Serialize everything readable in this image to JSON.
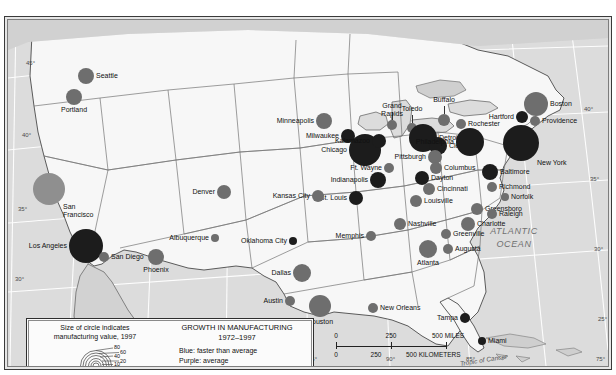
{
  "map": {
    "ocean_label": "ATLANTIC\nOCEAN",
    "ocean_line1": "ATLANTIC",
    "ocean_line2": "OCEAN",
    "tropic_label": "Tropic of Cancer",
    "lat_left": [
      "45°",
      "40°",
      "35°",
      "30°"
    ],
    "lat_right": [
      "40°",
      "35°",
      "30°",
      "25°"
    ],
    "lon_bottom": [
      "95°",
      "90°",
      "85°",
      "75°"
    ],
    "colors": {
      "land": "#f7f7f7",
      "ocean": "#dcdcdc",
      "border": "#2e2e2e",
      "red_slower": "#1c1c1c",
      "purple_average": "#6e6e6e",
      "blue_faster": "#8f8f8f"
    }
  },
  "legend": {
    "size_caption_line1": "Size of circle indicates",
    "size_caption_line2": "manufacturing value, 1997",
    "scale_values": [
      "80",
      "60",
      "40",
      "20",
      "10",
      "5"
    ],
    "title_line1": "GROWTH IN MANUFACTURING",
    "title_line2": "1972–1997",
    "keys": [
      "Blue:  faster than average",
      "Purple:  average",
      "Red:  slower than average"
    ]
  },
  "scalebar": {
    "miles": [
      "0",
      "250",
      "500 MILES"
    ],
    "kilometers": [
      "0",
      "250",
      "500 KILOMETERS"
    ],
    "miles_numbers": [
      "0",
      "250"
    ],
    "miles_unit": "500 MILES",
    "km_numbers": [
      "0",
      "250"
    ],
    "km_unit": "500 KILOMETERS"
  },
  "chart_data": {
    "type": "scatter",
    "title": "GROWTH IN MANUFACTURING 1972–1997",
    "xlabel": "Longitude",
    "ylabel": "Latitude",
    "size_encoding": "manufacturing value, 1997 (billions of dollars)",
    "size_legend_values": [
      80,
      60,
      40,
      20,
      10,
      5
    ],
    "color_encoding": {
      "blue": "faster than average",
      "purple": "average",
      "red": "slower than average"
    },
    "cities": [
      {
        "name": "Seattle",
        "x": 78,
        "y": 56,
        "r": 8,
        "growth": "purple",
        "label_pos": "right"
      },
      {
        "name": "Portland",
        "x": 66,
        "y": 77,
        "r": 8,
        "growth": "purple",
        "label_pos": "below"
      },
      {
        "name": "San Francisco",
        "x": 41,
        "y": 169,
        "r": 16,
        "growth": "blue",
        "label_pos": "below-right"
      },
      {
        "name": "Los Angeles",
        "x": 78,
        "y": 226,
        "r": 17,
        "growth": "red",
        "label_pos": "left"
      },
      {
        "name": "San Diego",
        "x": 96,
        "y": 237,
        "r": 5,
        "growth": "purple",
        "label_pos": "right"
      },
      {
        "name": "Phoenix",
        "x": 148,
        "y": 237,
        "r": 8,
        "growth": "purple",
        "label_pos": "below"
      },
      {
        "name": "Denver",
        "x": 216,
        "y": 172,
        "r": 7,
        "growth": "purple",
        "label_pos": "left"
      },
      {
        "name": "Albuquerque",
        "x": 207,
        "y": 218,
        "r": 4,
        "growth": "purple",
        "label_pos": "left"
      },
      {
        "name": "Minneapolis",
        "x": 316,
        "y": 101,
        "r": 8,
        "growth": "purple",
        "label_pos": "left"
      },
      {
        "name": "Milwaukee",
        "x": 340,
        "y": 116,
        "r": 7,
        "growth": "red",
        "label_pos": "left"
      },
      {
        "name": "Chicago",
        "x": 357,
        "y": 130,
        "r": 16,
        "growth": "red",
        "label_pos": "left"
      },
      {
        "name": "Kalamazoo",
        "x": 371,
        "y": 121,
        "r": 7,
        "growth": "red",
        "label_pos": "left"
      },
      {
        "name": "Grand Rapids",
        "x": 384,
        "y": 105,
        "r": 5,
        "growth": "purple",
        "label_pos": "above"
      },
      {
        "name": "Ft. Wayne",
        "x": 381,
        "y": 148,
        "r": 5,
        "growth": "purple",
        "label_pos": "left"
      },
      {
        "name": "Indianapolis",
        "x": 370,
        "y": 160,
        "r": 8,
        "growth": "red",
        "label_pos": "left"
      },
      {
        "name": "Toledo",
        "x": 404,
        "y": 108,
        "r": 5,
        "growth": "purple",
        "label_pos": "above"
      },
      {
        "name": "Detroit",
        "x": 415,
        "y": 118,
        "r": 14,
        "growth": "red",
        "label_pos": "right"
      },
      {
        "name": "Cleveland",
        "x": 430,
        "y": 126,
        "r": 9,
        "growth": "red",
        "label_pos": "right"
      },
      {
        "name": "Buffalo",
        "x": 436,
        "y": 100,
        "r": 6,
        "growth": "purple",
        "label_pos": "above"
      },
      {
        "name": "Rochester",
        "x": 453,
        "y": 104,
        "r": 5,
        "growth": "purple",
        "label_pos": "right"
      },
      {
        "name": "Pittsburgh",
        "x": 427,
        "y": 137,
        "r": 7,
        "growth": "purple",
        "label_pos": "left"
      },
      {
        "name": "Columbus",
        "x": 428,
        "y": 148,
        "r": 6,
        "growth": "purple",
        "label_pos": "right"
      },
      {
        "name": "Dayton",
        "x": 414,
        "y": 158,
        "r": 7,
        "growth": "red",
        "label_pos": "right"
      },
      {
        "name": "Cincinnati",
        "x": 421,
        "y": 169,
        "r": 6,
        "growth": "purple",
        "label_pos": "right"
      },
      {
        "name": "Louisville",
        "x": 408,
        "y": 181,
        "r": 6,
        "growth": "purple",
        "label_pos": "right"
      },
      {
        "name": "Nashville",
        "x": 392,
        "y": 204,
        "r": 6,
        "growth": "purple",
        "label_pos": "right"
      },
      {
        "name": "St. Louis",
        "x": 348,
        "y": 178,
        "r": 7,
        "growth": "red",
        "label_pos": "left"
      },
      {
        "name": "Kansas City",
        "x": 310,
        "y": 176,
        "r": 6,
        "growth": "purple",
        "label_pos": "left"
      },
      {
        "name": "Oklahoma City",
        "x": 285,
        "y": 221,
        "r": 4,
        "growth": "red",
        "label_pos": "left"
      },
      {
        "name": "Memphis",
        "x": 363,
        "y": 216,
        "r": 5,
        "growth": "purple",
        "label_pos": "left"
      },
      {
        "name": "Dallas",
        "x": 294,
        "y": 253,
        "r": 9,
        "growth": "purple",
        "label_pos": "left"
      },
      {
        "name": "Austin",
        "x": 282,
        "y": 281,
        "r": 5,
        "growth": "purple",
        "label_pos": "left"
      },
      {
        "name": "Houston",
        "x": 312,
        "y": 286,
        "r": 11,
        "growth": "purple",
        "label_pos": "below"
      },
      {
        "name": "New Orleans",
        "x": 365,
        "y": 288,
        "r": 5,
        "growth": "purple",
        "label_pos": "right"
      },
      {
        "name": "Atlanta",
        "x": 420,
        "y": 229,
        "r": 9,
        "growth": "purple",
        "label_pos": "below"
      },
      {
        "name": "Augusta",
        "x": 440,
        "y": 229,
        "r": 5,
        "growth": "purple",
        "label_pos": "right"
      },
      {
        "name": "Greenville",
        "x": 438,
        "y": 214,
        "r": 5,
        "growth": "purple",
        "label_pos": "right"
      },
      {
        "name": "Charlotte",
        "x": 460,
        "y": 204,
        "r": 7,
        "growth": "purple",
        "label_pos": "right"
      },
      {
        "name": "Greensboro",
        "x": 469,
        "y": 189,
        "r": 6,
        "growth": "purple",
        "label_pos": "right"
      },
      {
        "name": "Raleigh",
        "x": 484,
        "y": 194,
        "r": 5,
        "growth": "purple",
        "label_pos": "right"
      },
      {
        "name": "Richmond",
        "x": 484,
        "y": 167,
        "r": 5,
        "growth": "purple",
        "label_pos": "right"
      },
      {
        "name": "Norfolk",
        "x": 497,
        "y": 177,
        "r": 4,
        "growth": "purple",
        "label_pos": "right"
      },
      {
        "name": "Baltimore",
        "x": 482,
        "y": 152,
        "r": 8,
        "growth": "red",
        "label_pos": "right"
      },
      {
        "name": "Philadelphia",
        "x": 462,
        "y": 122,
        "r": 14,
        "growth": "red",
        "label_pos": "left"
      },
      {
        "name": "New York",
        "x": 513,
        "y": 123,
        "r": 18,
        "growth": "red",
        "label_pos": "below-right"
      },
      {
        "name": "Hartford",
        "x": 514,
        "y": 97,
        "r": 6,
        "growth": "red",
        "label_pos": "left"
      },
      {
        "name": "Providence",
        "x": 527,
        "y": 101,
        "r": 5,
        "growth": "purple",
        "label_pos": "right"
      },
      {
        "name": "Boston",
        "x": 528,
        "y": 84,
        "r": 12,
        "growth": "purple",
        "label_pos": "right"
      },
      {
        "name": "Tampa",
        "x": 457,
        "y": 298,
        "r": 5,
        "growth": "red",
        "label_pos": "left"
      },
      {
        "name": "Miami",
        "x": 474,
        "y": 321,
        "r": 4,
        "growth": "red",
        "label_pos": "right"
      }
    ]
  }
}
